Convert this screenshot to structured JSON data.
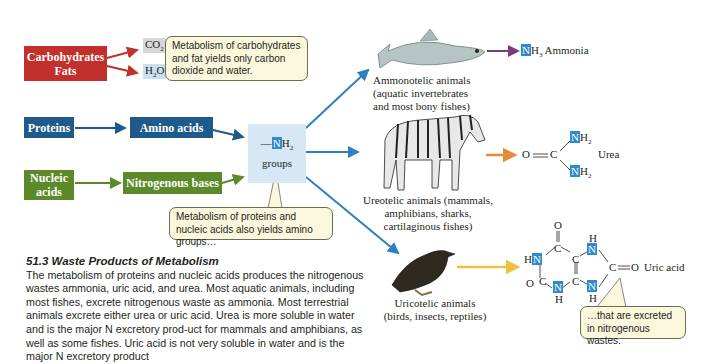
{
  "sources": {
    "carbs_fats": {
      "line1": "Carbohydrates",
      "line2": "Fats"
    },
    "proteins": "Proteins",
    "nucleic_acids": {
      "line1": "Nucleic",
      "line2": "acids"
    }
  },
  "intermediates": {
    "amino_acids": "Amino acids",
    "nitrogenous_bases": "Nitrogenous bases",
    "co2": {
      "main": "CO",
      "sub": "2"
    },
    "h2o": {
      "pre": "H",
      "sub": "2",
      "post": "O"
    },
    "nh2_group": {
      "dash": "—",
      "n": "N",
      "h": "H",
      "sub": "2",
      "label": "groups"
    }
  },
  "bubbles": {
    "carbs": "Metabolism of carbohydrates and fat yields only carbon dioxide and water.",
    "proteins": "Metabolism of proteins and nucleic acids also yields amino groups…",
    "excreted": "…that are excreted in nitrogenous wastes."
  },
  "animals": {
    "ammonotelic": {
      "line1": "Ammonotelic animals",
      "line2": "(aquatic invertebrates",
      "line3": "and most bony fishes)",
      "icon": "fish-icon"
    },
    "ureotelic": {
      "line1": "Ureotelic animals (mammals,",
      "line2": "amphibians, sharks,",
      "line3": "cartilaginous fishes)",
      "icon": "zebra-icon"
    },
    "uricotelic": {
      "line1": "Uricotelic animals",
      "line2": "(birds, insects, reptiles)",
      "icon": "bird-icon"
    }
  },
  "products": {
    "ammonia": {
      "n": "N",
      "h": "H",
      "sub": "3",
      "name": "Ammonia"
    },
    "urea": {
      "o": "O",
      "c": "C",
      "n": "N",
      "h": "H",
      "sub": "2",
      "name": "Urea"
    },
    "uric_acid": {
      "name": "Uric acid",
      "o": "O",
      "c": "C",
      "n": "N",
      "h": "H"
    }
  },
  "text": {
    "section_title": "51.3  Waste Products of Metabolism",
    "body": "The metabolism of proteins and nucleic acids produces the nitrogenous wastes ammonia, uric acid, and urea. Most aquatic animals, including most fishes, excrete nitrogenous waste as ammonia. Most terrestrial animals excrete either urea or uric acid. Urea is more soluble in water and is the major N excretory prod-uct for mammals and amphibians, as well as some fishes. Uric acid is not very soluble in water and is the major N excretory product"
  },
  "colors": {
    "red": "#c1302b",
    "blue": "#1f5b8a",
    "green": "#5c8a2b",
    "arrow_blue": "#2f7fbf",
    "purple": "#7a3c78",
    "orange": "#e8883a",
    "yellow": "#f0c040",
    "nbox": "#2f8bcc",
    "bubble": "#fbf7dd"
  }
}
